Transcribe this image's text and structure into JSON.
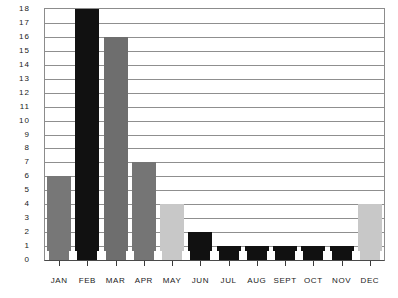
{
  "chart_data": {
    "type": "bar",
    "title": "",
    "subtitle": "",
    "xlabel": "",
    "ylabel": "",
    "categories": [
      "JAN",
      "FEB",
      "MAR",
      "APR",
      "MAY",
      "JUN",
      "JUL",
      "AUG",
      "SEPT",
      "OCT",
      "NOV",
      "DEC"
    ],
    "values": [
      6,
      18,
      16,
      7,
      4,
      2,
      1,
      1,
      1,
      1,
      1,
      4
    ],
    "bar_colors": [
      "#777777",
      "#111111",
      "#6e6e6e",
      "#757575",
      "#c8c8c8",
      "#111111",
      "#111111",
      "#111111",
      "#111111",
      "#111111",
      "#111111",
      "#c8c8c8"
    ],
    "ylim": [
      0,
      18
    ],
    "ytick_step": 1,
    "yticks": [
      "0",
      "1",
      "2",
      "3",
      "4",
      "5",
      "6",
      "7",
      "8",
      "9",
      "10",
      "11",
      "12",
      "13",
      "14",
      "15",
      "16",
      "17",
      "18"
    ],
    "grid": true,
    "grid_axis": "y",
    "legend": false,
    "legend_position": "none",
    "axis_color": "#8c8c8c",
    "grid_color": "#8f8f8f",
    "baseline_color": "#4a4a4a",
    "background": "#ffffff"
  }
}
